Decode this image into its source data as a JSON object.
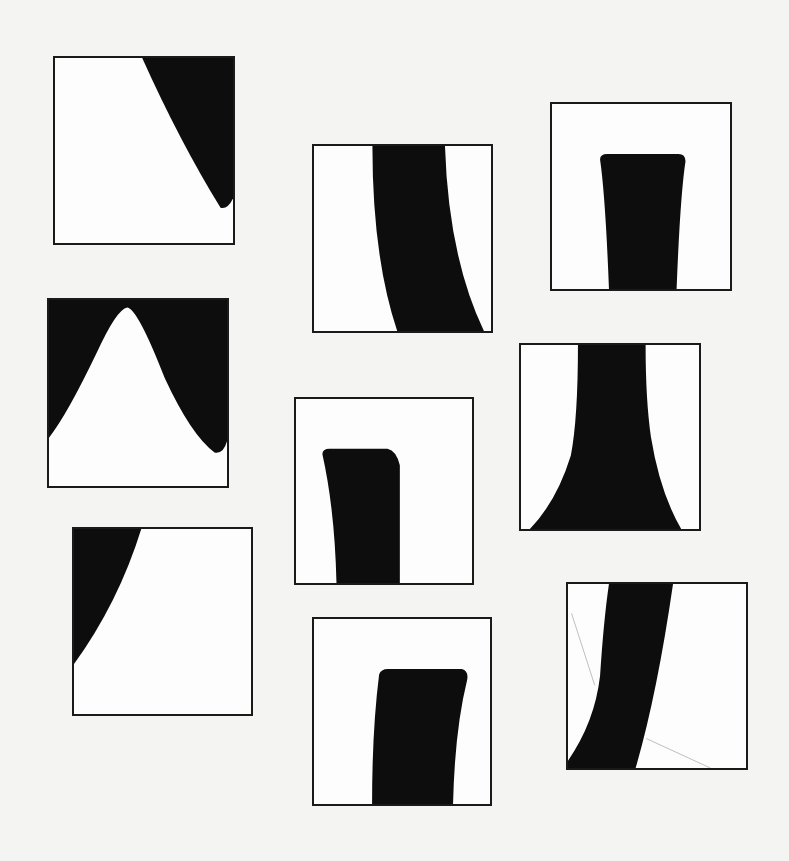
{
  "sheet": {
    "background": "#f4f4f2",
    "fill_color": "#0d0d0d",
    "frame_border_color": "#1a1a1a",
    "frames": [
      {
        "id": 1,
        "shape": "curved-wedge-top-right",
        "x": 53,
        "y": 56,
        "w": 182,
        "h": 189,
        "path": "M49,0 L100,0 L100,76 Q97,82 93,81 Q70,45 49,0 Z"
      },
      {
        "id": 2,
        "shape": "curved-band-descending-right",
        "x": 312,
        "y": 144,
        "w": 181,
        "h": 189,
        "path": "M33,0 L74,0 Q76,60 96,100 L47,100 Q33,60 33,0 Z"
      },
      {
        "id": 3,
        "shape": "rounded-column-narrowing",
        "x": 550,
        "y": 102,
        "w": 182,
        "h": 189,
        "path": "M27,30 Q27,27 31,27 L71,27 Q75,27 75,31 Q72,50 70,100 L32,100 Q30,50 27,30 Z"
      },
      {
        "id": 4,
        "shape": "bell-curve-cutout",
        "x": 47,
        "y": 298,
        "w": 182,
        "h": 190,
        "path": "M0,0 L100,0 L100,76 Q98,83 93,82 Q80,73 65,42 Q50,5 44,4 Q38,5 27,28 Q10,62 0,74 Z"
      },
      {
        "id": 5,
        "shape": "rounded-column-bent",
        "x": 294,
        "y": 397,
        "w": 180,
        "h": 188,
        "path": "M15,30 Q15,27 19,27 L52,27 Q57,28 59,36 Q59,60 59,100 L23,100 Q22,60 15,30 Z"
      },
      {
        "id": 6,
        "shape": "flared-column",
        "x": 519,
        "y": 343,
        "w": 182,
        "h": 188,
        "path": "M32,0 L70,0 Q70,30 73,50 Q78,80 90,100 L5,100 Q20,85 28,60 Q32,40 32,0 Z"
      },
      {
        "id": 7,
        "shape": "curved-wedge-top-left",
        "x": 72,
        "y": 527,
        "w": 181,
        "h": 189,
        "path": "M0,0 L38,0 Q25,40 0,73 Z"
      },
      {
        "id": 8,
        "shape": "rounded-column-leaning",
        "x": 312,
        "y": 617,
        "w": 180,
        "h": 189,
        "path": "M37,30 Q38,27 42,27 L84,27 Q88,28 87,33 Q80,60 79,100 L33,100 Q33,60 37,30 Z"
      },
      {
        "id": 9,
        "shape": "curved-band-ascending-right",
        "x": 566,
        "y": 582,
        "w": 182,
        "h": 188,
        "path": "M23,0 L59,0 Q50,60 38,100 L0,100 L0,96 Q15,75 18,50 Q20,20 23,0 Z",
        "faint_lines": [
          "M2,16 L15,55",
          "M44,84 L80,100"
        ]
      }
    ]
  }
}
